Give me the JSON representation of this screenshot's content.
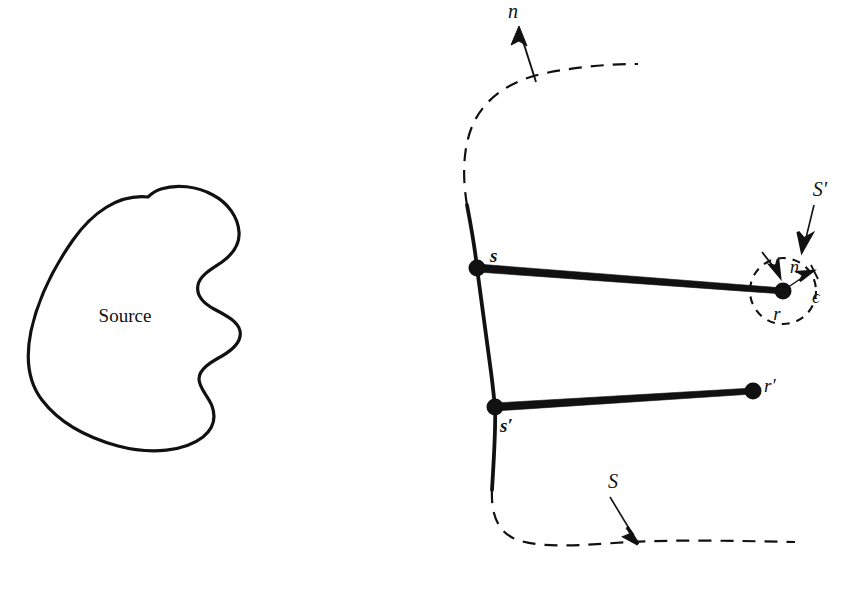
{
  "figure": {
    "background_color": "#ffffff",
    "ink_color": "#111111",
    "width": 862,
    "height": 594
  },
  "source_region": {
    "label": "Source",
    "label_x": 125,
    "label_y": 322,
    "font_size": 19,
    "stroke_width": 3.2,
    "description": "irregular closed blob outline with concave wavy notch on right side"
  },
  "surface": {
    "normal_label": "n",
    "normal_label_x": 508,
    "normal_label_y": 18,
    "surface_label": "S",
    "surface_label_x": 613,
    "surface_label_y": 488,
    "solid_stroke_width": 3.6,
    "dashed_stroke_width": 2.2,
    "dash_pattern": "13,9"
  },
  "small_circle": {
    "label": "S'",
    "label_x": 820,
    "label_y": 196,
    "inner_normal_label": "n",
    "inner_normal_label_x": 790,
    "inner_normal_label_y": 272,
    "radius_label": "ϵ",
    "radius_label_x": 818,
    "radius_label_y": 300,
    "center_x": 783,
    "center_y": 291,
    "radius": 33,
    "dash_pattern": "8,7",
    "stroke_width": 2.1
  },
  "points": [
    {
      "name": "s",
      "label": "s",
      "label_x": 490,
      "label_y": 262,
      "x": 477,
      "y": 268,
      "dot_radius": 8.5,
      "style": "bolditalic"
    },
    {
      "name": "s-prime",
      "label": "s′",
      "label_x": 500,
      "label_y": 431,
      "x": 495,
      "y": 407,
      "dot_radius": 8.5,
      "style": "bolditalic"
    },
    {
      "name": "r",
      "label": "r",
      "label_x": 777,
      "label_y": 318,
      "x": 783,
      "y": 291,
      "dot_radius": 8.5,
      "style": "italic"
    },
    {
      "name": "r-prime",
      "label": "r′",
      "label_x": 763,
      "label_y": 391,
      "x": 753,
      "y": 391,
      "dot_radius": 8.5,
      "style": "italic"
    }
  ],
  "connector_lines": [
    {
      "name": "s-to-r",
      "from": "s",
      "to": "r",
      "x1": 477,
      "y1": 268,
      "x2": 783,
      "y2": 291,
      "stroke_width": 4.5
    },
    {
      "name": "s-prime-to-r-prime",
      "from": "s′",
      "to": "r′",
      "x1": 495,
      "y1": 407,
      "x2": 753,
      "y2": 391,
      "stroke_width": 4.5
    }
  ],
  "arrows": [
    {
      "name": "outward-normal-arrow",
      "label": "n",
      "x1": 536,
      "y1": 82,
      "x2": 519,
      "y2": 26
    },
    {
      "name": "surface-S-arrow",
      "label": "S",
      "x1": 610,
      "y1": 497,
      "x2": 637,
      "y2": 543
    },
    {
      "name": "small-surface-S-prime-arrow",
      "label": "S′",
      "x1": 814,
      "y1": 205,
      "x2": 802,
      "y2": 250
    },
    {
      "name": "inner-normal-arrow",
      "label": "n",
      "x1": 763,
      "y1": 253,
      "x2": 779,
      "y2": 275
    },
    {
      "name": "epsilon-radius-arrow",
      "label": "ϵ",
      "x1": 783,
      "y1": 291,
      "x2": 812,
      "y2": 272
    }
  ]
}
